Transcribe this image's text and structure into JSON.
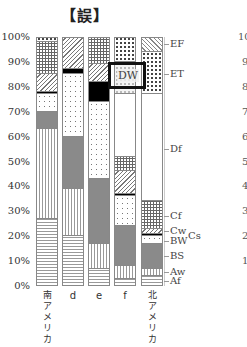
{
  "header": {
    "title": "【誤】"
  },
  "chart_data": {
    "type": "bar",
    "stacked": true,
    "title": "【誤】",
    "xlabel": "",
    "ylabel": "",
    "ylim": [
      0,
      100
    ],
    "yticks": [
      "0%",
      "10%",
      "20%",
      "30%",
      "40%",
      "50%",
      "60%",
      "70%",
      "80%",
      "90%",
      "100%"
    ],
    "categories": [
      "南アメリカ",
      "d",
      "e",
      "f",
      "北アメリカ"
    ],
    "category_labels_vertical": [
      [
        "南",
        "ア",
        "メ",
        "リ",
        "カ"
      ],
      [
        "d"
      ],
      [
        "e"
      ],
      [
        "f"
      ],
      [
        "北",
        "ア",
        "メ",
        "リ",
        "カ"
      ]
    ],
    "climate_order": [
      "Af",
      "Aw",
      "BS",
      "BW",
      "Cs",
      "Cw",
      "Cf",
      "Df",
      "DW",
      "ET",
      "EF"
    ],
    "series": [
      {
        "name": "Af",
        "values": [
          27,
          20,
          7,
          3,
          4
        ]
      },
      {
        "name": "Aw",
        "values": [
          36,
          19,
          10,
          5,
          3
        ]
      },
      {
        "name": "BS",
        "values": [
          7,
          21,
          26,
          16,
          10
        ]
      },
      {
        "name": "BW",
        "values": [
          7,
          25,
          31,
          12,
          3
        ]
      },
      {
        "name": "Cs",
        "values": [
          1,
          2,
          8,
          1,
          1
        ]
      },
      {
        "name": "Cw",
        "values": [
          7,
          13,
          7,
          9,
          2
        ]
      },
      {
        "name": "Cf",
        "values": [
          13,
          0,
          11,
          6,
          11
        ]
      },
      {
        "name": "Df",
        "values": [
          0,
          0,
          0,
          25,
          43
        ]
      },
      {
        "name": "DW",
        "values": [
          0,
          0,
          0,
          13,
          0
        ]
      },
      {
        "name": "ET",
        "values": [
          2,
          0,
          0,
          10,
          17
        ]
      },
      {
        "name": "EF",
        "values": [
          0,
          0,
          0,
          0,
          6
        ]
      }
    ],
    "legend_labels_right": [
      "EF",
      "ET",
      "Df",
      "Cf",
      "Cw",
      "Cs",
      "BW",
      "BS",
      "Aw",
      "Af"
    ],
    "annotations": [
      {
        "text": "DW",
        "box": true,
        "column": "f"
      }
    ],
    "grid": false
  },
  "columns": [
    {
      "label": "南アメリカ",
      "label_chars": [
        "南",
        "ア",
        "メ",
        "リ",
        "カ"
      ],
      "segments": [
        {
          "k": "Af",
          "from": 0,
          "to": 27
        },
        {
          "k": "Aw",
          "from": 27,
          "to": 63
        },
        {
          "k": "BS",
          "from": 63,
          "to": 70
        },
        {
          "k": "BW",
          "from": 70,
          "to": 77
        },
        {
          "k": "Cs",
          "from": 77,
          "to": 78
        },
        {
          "k": "Cw",
          "from": 78,
          "to": 85
        },
        {
          "k": "Cf",
          "from": 85,
          "to": 98
        },
        {
          "k": "ET",
          "from": 98,
          "to": 100
        }
      ]
    },
    {
      "label": "d",
      "label_chars": [
        "d"
      ],
      "segments": [
        {
          "k": "Af",
          "from": 0,
          "to": 20
        },
        {
          "k": "Aw",
          "from": 20,
          "to": 39
        },
        {
          "k": "BS",
          "from": 39,
          "to": 60
        },
        {
          "k": "BW",
          "from": 60,
          "to": 85
        },
        {
          "k": "Cs",
          "from": 85,
          "to": 87
        },
        {
          "k": "Cw",
          "from": 87,
          "to": 100
        }
      ]
    },
    {
      "label": "e",
      "label_chars": [
        "e"
      ],
      "segments": [
        {
          "k": "Af",
          "from": 0,
          "to": 7
        },
        {
          "k": "Aw",
          "from": 7,
          "to": 17
        },
        {
          "k": "BS",
          "from": 17,
          "to": 43
        },
        {
          "k": "BW",
          "from": 43,
          "to": 74
        },
        {
          "k": "Cs",
          "from": 74,
          "to": 82
        },
        {
          "k": "Cw",
          "from": 82,
          "to": 89
        },
        {
          "k": "Cf",
          "from": 89,
          "to": 100
        }
      ]
    },
    {
      "label": "f",
      "label_chars": [
        "f"
      ],
      "segments": [
        {
          "k": "Af",
          "from": 0,
          "to": 3
        },
        {
          "k": "Aw",
          "from": 3,
          "to": 8
        },
        {
          "k": "BS",
          "from": 8,
          "to": 24
        },
        {
          "k": "BW",
          "from": 24,
          "to": 36
        },
        {
          "k": "Cs",
          "from": 36,
          "to": 37
        },
        {
          "k": "Cw",
          "from": 37,
          "to": 46
        },
        {
          "k": "Cf",
          "from": 46,
          "to": 52
        },
        {
          "k": "Df",
          "from": 52,
          "to": 77
        },
        {
          "k": "DW",
          "from": 77,
          "to": 90
        },
        {
          "k": "ET",
          "from": 90,
          "to": 100
        }
      ]
    },
    {
      "label": "北アメリカ",
      "label_chars": [
        "北",
        "ア",
        "メ",
        "リ",
        "カ"
      ],
      "segments": [
        {
          "k": "Af",
          "from": 0,
          "to": 4
        },
        {
          "k": "Aw",
          "from": 4,
          "to": 7
        },
        {
          "k": "BS",
          "from": 7,
          "to": 17
        },
        {
          "k": "BW",
          "from": 17,
          "to": 20
        },
        {
          "k": "Cs",
          "from": 20,
          "to": 21
        },
        {
          "k": "Cw",
          "from": 21,
          "to": 23
        },
        {
          "k": "Cf",
          "from": 23,
          "to": 34
        },
        {
          "k": "Df",
          "from": 34,
          "to": 77
        },
        {
          "k": "ET",
          "from": 77,
          "to": 94
        },
        {
          "k": "EF",
          "from": 94,
          "to": 100
        }
      ]
    }
  ],
  "right_labels": [
    {
      "text": "EF",
      "pct": 97
    },
    {
      "text": "ET",
      "pct": 85
    },
    {
      "text": "Df",
      "pct": 55
    },
    {
      "text": "Cf",
      "pct": 28
    },
    {
      "text": "Cw",
      "pct": 22
    },
    {
      "text": "Cs",
      "pct": 21
    },
    {
      "text": "BW",
      "pct": 18
    },
    {
      "text": "BS",
      "pct": 12
    },
    {
      "text": "Aw",
      "pct": 5.5
    },
    {
      "text": "Af",
      "pct": 2
    }
  ],
  "dw_label": "DW",
  "clipped_next_chart_ticks": [
    "10",
    "9",
    "8",
    "7",
    "6",
    "5",
    "4",
    "3",
    "2",
    "1"
  ]
}
